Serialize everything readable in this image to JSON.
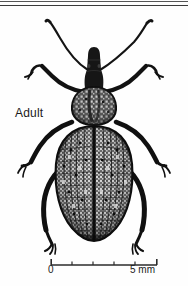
{
  "figure": {
    "kind": "scientific-illustration",
    "label": "Adult",
    "background_color": "#fefefe",
    "ink_color": "#1a1a1a"
  },
  "rules": {
    "top_line_color": "#555555",
    "bottom_line_color": "#3a3a3a"
  },
  "scale_bar": {
    "left_label": "0",
    "right_label": "5 mm",
    "min": 0,
    "max": 5,
    "unit": "mm",
    "major_ticks": 2,
    "minor_ticks": 4,
    "line_color": "#2b2b2b"
  }
}
